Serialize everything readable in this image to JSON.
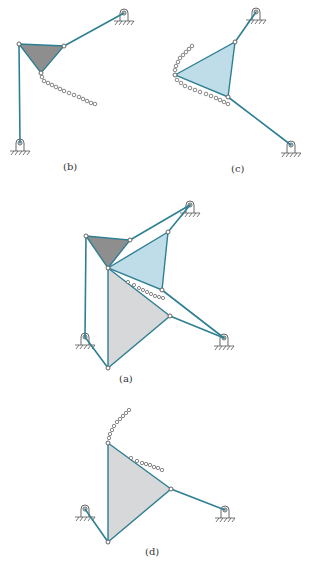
{
  "figure": {
    "panels": [
      {
        "id": "b",
        "label": "(b)",
        "description": "Dark triangular coupler with two ground-pivoted links and coupler curve"
      },
      {
        "id": "c",
        "label": "(c)",
        "description": "Blue triangular coupler with two ground-pivoted links and coupler curve"
      },
      {
        "id": "a",
        "label": "(a)",
        "description": "Combined linkage: dark, blue and gray triangles"
      },
      {
        "id": "d",
        "label": "(d)",
        "description": "Gray triangular coupler with two ground-pivoted links and coupler curve"
      }
    ],
    "colors": {
      "link": "#2f7f93",
      "dark_triangle": "#8e8e8e",
      "blue_triangle": "#bfdde8",
      "gray_triangle": "#d6d8d9"
    }
  }
}
